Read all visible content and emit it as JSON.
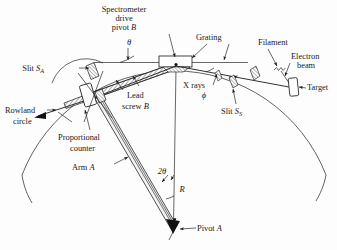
{
  "figure": {
    "background_color": "#fdfdfd",
    "ink_color": "#1a1a1a",
    "width": 337,
    "height": 250
  },
  "labels": {
    "spectrometer_drive_line1": "Spectrometer",
    "spectrometer_drive_line2": "drive",
    "spectrometer_drive_line3": "pivot B",
    "grating": "Grating",
    "filament": "Filament",
    "electron_line1": "Electron",
    "electron_line2": "beam",
    "target": "Target",
    "slit_s_prefix": "Slit S",
    "slit_s_sub": "S",
    "slit_a_prefix": "Slit S",
    "slit_a_sub": "A",
    "x_rays": "X rays",
    "rowland_line1": "Rowland",
    "rowland_line2": "circle",
    "lead_line1": "Lead",
    "lead_line2": "screw B",
    "proportional_line1": "Proportional",
    "proportional_line2": "counter",
    "arm_a": "Arm A",
    "pivot_a": "Pivot A",
    "theta": "θ",
    "phi": "ϕ",
    "two_theta": "2θ",
    "radius_r": "R"
  },
  "icons": {
    "arrow": "arrow-head-icon",
    "grating_box": "grating-rectangle-icon",
    "target_box": "target-rectangle-icon",
    "counter_box": "proportional-counter-icon",
    "slit_block": "slit-block-icon"
  },
  "geometry": {
    "pivot_b": [
      176,
      64
    ],
    "pivot_a": [
      173,
      229
    ],
    "grating_rect": [
      159,
      56,
      33,
      11
    ],
    "radius_line": [
      176,
      68,
      173,
      228
    ],
    "horizontal_reference": [
      94,
      62,
      248,
      62
    ],
    "rowland_center": [
      173,
      12
    ],
    "rowland_radius": 163,
    "arm_start": [
      97,
      101
    ],
    "arm_end": [
      173,
      228
    ],
    "target_rect": [
      290,
      79,
      9,
      17
    ]
  }
}
